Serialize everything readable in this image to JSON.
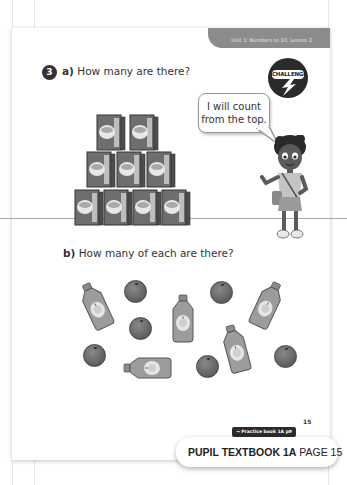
{
  "header": {
    "unit_tab": "Unit 1: Numbers to 10, Lesson 2"
  },
  "question": {
    "number": "3",
    "part_a": {
      "letter": "a)",
      "text": "How many are there?"
    },
    "part_b": {
      "letter": "b)",
      "text": "How many of each are there?"
    }
  },
  "challenge_badge": {
    "label": "CHALLENGE"
  },
  "speech_bubble": {
    "line1": "I will count",
    "line2": "from the top."
  },
  "illustrations": {
    "cereal_boxes": {
      "rows": [
        2,
        3,
        4
      ],
      "total": 9
    },
    "bottles": 5,
    "oranges": 7
  },
  "footer": {
    "page_number": "15",
    "practice_link": "→ Practice book 1A p9",
    "textbook_label": "PUPIL TEXTBOOK 1A",
    "page_label": "PAGE 15"
  },
  "colors": {
    "tab": "#8c8c8c",
    "badge": "#333333",
    "challenge": "#2b2b2b"
  }
}
